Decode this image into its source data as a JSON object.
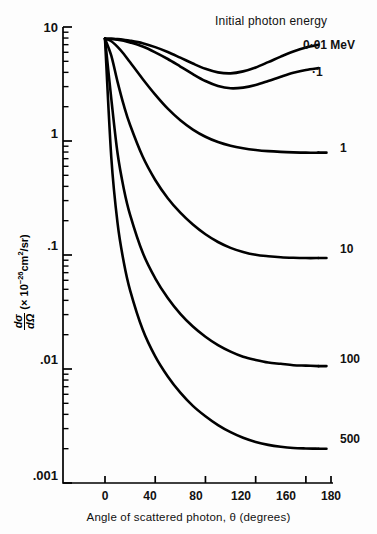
{
  "chart_data": {
    "type": "line",
    "title": "",
    "legend_title": "Initial photon energy",
    "legend_position": "inline-right-of-curves",
    "xlabel": "Angle of scattered photon, θ (degrees)",
    "ylabel_parts": {
      "fraction_num": "dσ",
      "fraction_den": "dΩ",
      "units": "(× 10",
      "exponent": "-26",
      "units_tail": "cm",
      "units_sup": "2",
      "units_end": "/sr)"
    },
    "xlim": [
      -20,
      190
    ],
    "ylim": [
      0.001,
      10
    ],
    "xscale": "linear",
    "yscale": "log",
    "grid": false,
    "xticks": [
      0,
      40,
      80,
      120,
      160,
      180
    ],
    "xtick_labels": [
      "0",
      "40",
      "80",
      "120",
      "160",
      "180"
    ],
    "yticks": [
      10,
      1,
      0.1,
      0.01,
      0.001
    ],
    "ytick_labels": [
      "10",
      "1",
      ".1",
      ".01",
      ".001"
    ],
    "x": [
      0,
      5,
      10,
      15,
      20,
      30,
      40,
      50,
      60,
      70,
      80,
      90,
      100,
      110,
      120,
      130,
      140,
      150,
      160,
      170
    ],
    "series": [
      {
        "name": "0.01 MeV",
        "label": "0·01 MeV",
        "label_value": "0.01",
        "values": [
          7.9,
          7.88,
          7.82,
          7.72,
          7.58,
          7.2,
          6.66,
          6.04,
          5.38,
          4.78,
          4.3,
          4.0,
          3.92,
          4.08,
          4.42,
          4.92,
          5.5,
          6.1,
          6.62,
          7.0
        ]
      },
      {
        "name": "0.1 MeV",
        "label": "·1",
        "label_value": "0.1",
        "values": [
          7.9,
          7.86,
          7.74,
          7.56,
          7.32,
          6.74,
          6.0,
          5.24,
          4.5,
          3.86,
          3.36,
          3.04,
          2.9,
          2.94,
          3.1,
          3.36,
          3.66,
          3.96,
          4.2,
          4.36
        ]
      },
      {
        "name": "1 MeV",
        "label": "1",
        "label_value": "1",
        "values": [
          7.9,
          7.5,
          6.7,
          5.8,
          4.9,
          3.5,
          2.55,
          1.92,
          1.52,
          1.26,
          1.09,
          0.98,
          0.91,
          0.865,
          0.835,
          0.815,
          0.803,
          0.795,
          0.79,
          0.79
        ]
      },
      {
        "name": "10 MeV",
        "label": "10",
        "label_value": "10",
        "values": [
          7.9,
          5.6,
          3.3,
          2.05,
          1.38,
          0.73,
          0.455,
          0.315,
          0.235,
          0.185,
          0.152,
          0.13,
          0.1155,
          0.1065,
          0.1005,
          0.0975,
          0.0955,
          0.0945,
          0.094,
          0.094
        ]
      },
      {
        "name": "100 MeV",
        "label": "100",
        "label_value": "100",
        "values": [
          7.9,
          2.35,
          0.78,
          0.38,
          0.225,
          0.105,
          0.0625,
          0.042,
          0.0305,
          0.0236,
          0.0192,
          0.0162,
          0.0142,
          0.0128,
          0.012,
          0.0114,
          0.0111,
          0.0108,
          0.0107,
          0.0106
        ]
      },
      {
        "name": "500 MeV",
        "label": "500",
        "label_value": "500",
        "values": [
          7.9,
          0.72,
          0.19,
          0.086,
          0.049,
          0.0222,
          0.0129,
          0.0086,
          0.0062,
          0.00475,
          0.00385,
          0.00322,
          0.00279,
          0.00249,
          0.00229,
          0.00216,
          0.00208,
          0.00203,
          0.00201,
          0.002
        ]
      }
    ]
  },
  "axis": {
    "legend_title": "Initial photon energy",
    "xlabel": "Angle of scattered photon, θ (degrees)",
    "ytick_labels": [
      "10",
      "1",
      ".1",
      ".01",
      ".001"
    ],
    "xtick_labels": [
      "0",
      "40",
      "80",
      "120",
      "160",
      "180"
    ]
  },
  "curve_labels": {
    "c0": "0·01 MeV",
    "c1": "·1",
    "c2": "1",
    "c3": "10",
    "c4": "100",
    "c5": "500"
  },
  "ylabel": {
    "num": "dσ",
    "den": "dΩ",
    "open": "(× 10",
    "exp": "−26",
    "cm": "cm",
    "sq": "2",
    "close": "/sr)"
  }
}
